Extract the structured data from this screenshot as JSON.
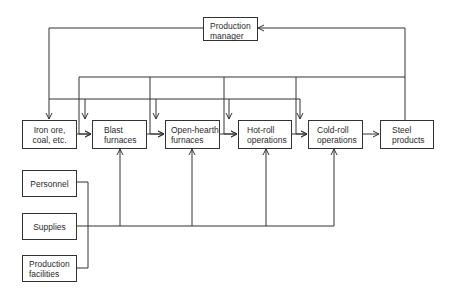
{
  "diagram": {
    "manager": {
      "line1": "Production",
      "line2": "manager"
    },
    "flow": [
      {
        "id": "iron-ore",
        "line1": "Iron ore,",
        "line2": "coal, etc."
      },
      {
        "id": "blast-furnaces",
        "line1": "Blast",
        "line2": "furnaces"
      },
      {
        "id": "open-hearth-furnaces",
        "line1": "Open-hearth",
        "line2": "furnaces"
      },
      {
        "id": "hot-roll-operations",
        "line1": "Hot-roll",
        "line2": "operations"
      },
      {
        "id": "cold-roll-operations",
        "line1": "Cold-roll",
        "line2": "operations"
      },
      {
        "id": "steel-products",
        "line1": "Steel",
        "line2": "products"
      }
    ],
    "inputs": [
      {
        "id": "personnel",
        "line1": "Personnel",
        "line2": ""
      },
      {
        "id": "supplies",
        "line1": "Supplies",
        "line2": ""
      },
      {
        "id": "production-facilities",
        "line1": "Production",
        "line2": "facilities"
      }
    ],
    "colors": {
      "line": "#333333",
      "background": "#ffffff"
    }
  }
}
